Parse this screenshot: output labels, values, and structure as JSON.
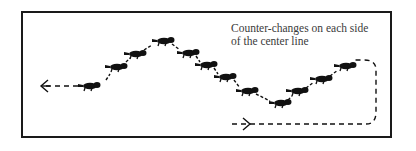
{
  "diagram": {
    "caption_line1": "Counter-changes on each side",
    "caption_line2": "of the center line",
    "colors": {
      "ink": "#111111",
      "frame": "#1a1a1a",
      "text": "#3a3a3a",
      "background": "#ffffff"
    },
    "horses": [
      {
        "x": 88,
        "y": 86
      },
      {
        "x": 115,
        "y": 67
      },
      {
        "x": 134,
        "y": 54
      },
      {
        "x": 162,
        "y": 41
      },
      {
        "x": 187,
        "y": 53
      },
      {
        "x": 205,
        "y": 65
      },
      {
        "x": 224,
        "y": 77
      },
      {
        "x": 246,
        "y": 91
      },
      {
        "x": 279,
        "y": 103
      },
      {
        "x": 296,
        "y": 91
      },
      {
        "x": 320,
        "y": 79
      },
      {
        "x": 344,
        "y": 66
      }
    ],
    "entry_arrow": "dashed line entering bottom-right pointing right",
    "exit_arrow": "dashed line exiting left pointing left"
  }
}
